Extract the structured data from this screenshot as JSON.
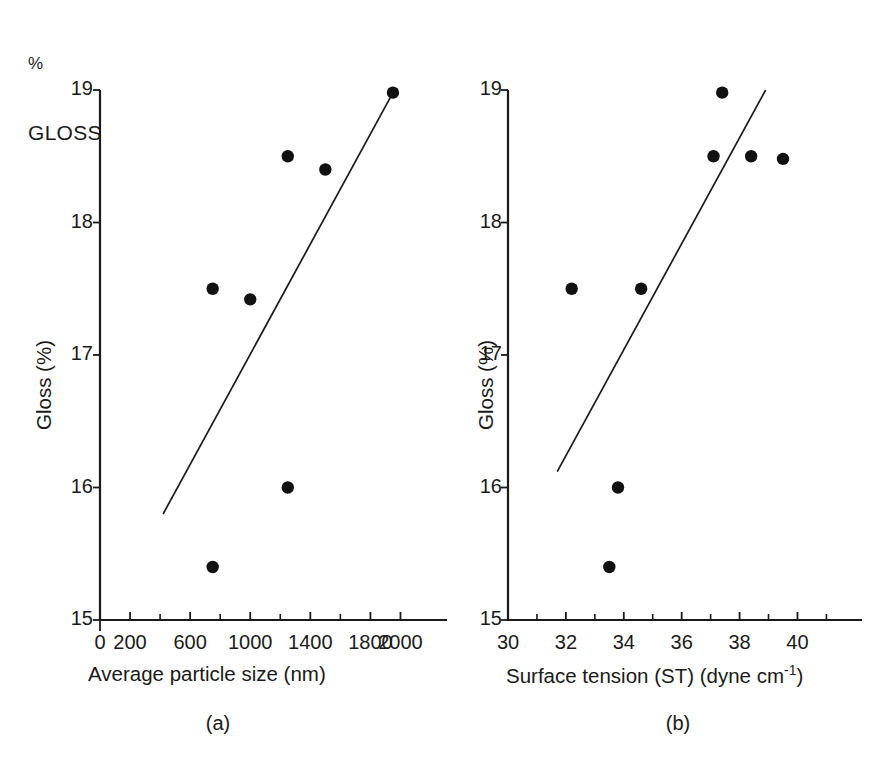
{
  "figure": {
    "corner_label_line1": "%",
    "corner_label_line2": "GLOSS",
    "background_color": "#ffffff",
    "ink_color": "#1a1a1a"
  },
  "panels": [
    {
      "caption": "(a)",
      "ylabel": "Gloss (%)",
      "xlabel": "Average particle size (nm)",
      "xlabel_sup": "",
      "y_ticks": [
        "19",
        "18",
        "17",
        "16",
        "15"
      ],
      "x_ticks": [
        "0",
        "200",
        "600",
        "1000",
        "1400",
        "1800",
        "2000"
      ]
    },
    {
      "caption": "(b)",
      "ylabel": "Gloss (%)",
      "xlabel": "Surface tension (ST) (dyne cm",
      "xlabel_sup": "-1",
      "xlabel_tail": ")",
      "y_ticks": [
        "19",
        "18",
        "17",
        "16",
        "15"
      ],
      "x_ticks": [
        "30",
        "32",
        "34",
        "36",
        "38",
        "40"
      ]
    }
  ],
  "chart_data": [
    {
      "type": "scatter",
      "title": "(a)",
      "xlabel": "Average particle size (nm)",
      "ylabel": "Gloss (%)",
      "xlim": [
        0,
        2150
      ],
      "ylim": [
        15,
        19
      ],
      "xtick_values": [
        0,
        200,
        600,
        1000,
        1400,
        1800,
        2000
      ],
      "xtick_labels": [
        "0",
        "200",
        "600",
        "1000",
        "1400",
        "1800",
        "2000"
      ],
      "xtick_minor_step": 200,
      "ytick_values": [
        15,
        16,
        17,
        18,
        19
      ],
      "ytick_labels": [
        "15",
        "16",
        "17",
        "18",
        "19"
      ],
      "grid": false,
      "legend": false,
      "x": [
        750,
        750,
        1000,
        1250,
        1250,
        1500,
        1950
      ],
      "y": [
        15.4,
        17.5,
        17.42,
        16.0,
        18.5,
        18.4,
        18.98
      ],
      "points": [
        {
          "x": 750,
          "y": 17.5
        },
        {
          "x": 1000,
          "y": 17.42
        },
        {
          "x": 1250,
          "y": 18.5
        },
        {
          "x": 1500,
          "y": 18.4
        },
        {
          "x": 1950,
          "y": 18.98
        },
        {
          "x": 1250,
          "y": 16.0
        },
        {
          "x": 750,
          "y": 15.4
        }
      ],
      "trendline": {
        "x0": 420,
        "y0": 15.8,
        "x1": 1950,
        "y1": 18.98
      }
    },
    {
      "type": "scatter",
      "title": "(b)",
      "xlabel": "Surface tension (ST) (dyne cm-1)",
      "ylabel": "Gloss (%)",
      "xlim": [
        30,
        41.4
      ],
      "ylim": [
        15,
        19
      ],
      "xtick_values": [
        30,
        31,
        32,
        33,
        34,
        35,
        36,
        37,
        38,
        39,
        40,
        41
      ],
      "xtick_labels": [
        "30",
        "",
        "32",
        "",
        "34",
        "",
        "36",
        "",
        "38",
        "",
        "40",
        ""
      ],
      "ytick_values": [
        15,
        16,
        17,
        18,
        19
      ],
      "ytick_labels": [
        "15",
        "16",
        "17",
        "18",
        "19"
      ],
      "grid": false,
      "legend": false,
      "x": [
        32.2,
        33.5,
        33.8,
        34.6,
        37.1,
        37.4,
        38.4,
        39.5
      ],
      "y": [
        17.5,
        15.4,
        16.0,
        17.5,
        18.5,
        18.98,
        18.5,
        18.48
      ],
      "points": [
        {
          "x": 32.2,
          "y": 17.5
        },
        {
          "x": 34.6,
          "y": 17.5
        },
        {
          "x": 33.8,
          "y": 16.0
        },
        {
          "x": 33.5,
          "y": 15.4
        },
        {
          "x": 37.1,
          "y": 18.5
        },
        {
          "x": 37.4,
          "y": 18.98
        },
        {
          "x": 38.4,
          "y": 18.5
        },
        {
          "x": 39.5,
          "y": 18.48
        }
      ],
      "trendline": {
        "x0": 31.7,
        "y0": 16.12,
        "x1": 38.9,
        "y1": 19.0
      }
    }
  ]
}
